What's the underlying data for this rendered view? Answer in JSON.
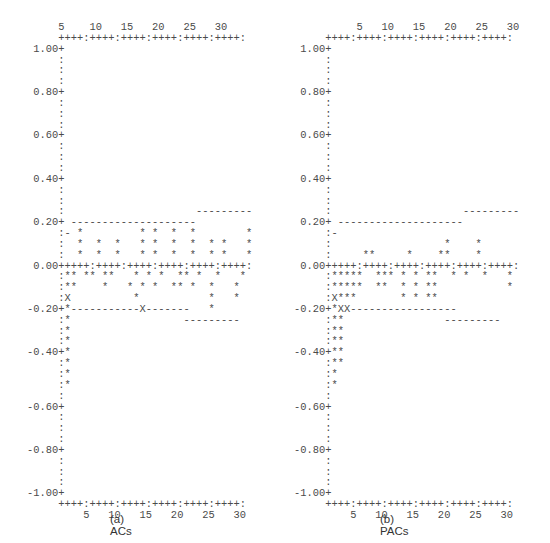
{
  "chart_data": [
    {
      "type": "bar",
      "title": "(a) ACs",
      "style": "ascii-correlogram",
      "xlabel": "lag",
      "ylabel": "autocorrelation",
      "x_ticks": [
        5,
        10,
        15,
        20,
        25,
        30
      ],
      "y_ticks": [
        "1.00",
        "0.80",
        "0.60",
        "0.40",
        "0.20",
        "0.00",
        "-0.20",
        "-0.40",
        "-0.60",
        "-0.80",
        "-1.00"
      ],
      "ylim": [
        -1.0,
        1.0
      ],
      "xlim": [
        1,
        30
      ],
      "confidence_bands": {
        "lags_1_20": [
          -0.2,
          0.2
        ],
        "lags_23_30": [
          -0.25,
          0.25
        ]
      },
      "description": "Lag 1 ACF strongly negative (~-0.5); remaining lags small within bands",
      "lines": [
        "     5    10   15   20   25   30",
        "+++++:++++:++++:++++:++++:++++:",
        "1.00+",
        "    :",
        "    :",
        "    :",
        "0.80+",
        "    :",
        "    :",
        "    :",
        "0.60+",
        "    :",
        "    :",
        "    :",
        "0.40+",
        "    :",
        "    :",
        "    :                     ---------",
        "0.20+ --------------------",
        "    :- *         * *  *  *        *",
        "    :  *  *  *   * *  *  *  * *   *",
        "    :  *  *  *   * *  *  *  * *   *",
        "0.00+++++:++++:++++:++++:++++:++++:",
        "    :** ** **   * * *  ** *  *   *",
        "    :**    *   * * *  ** *  *   *",
        "    :X          *           *   *",
        "-0.20+*-----------X-------   *",
        "    :*                  ---------",
        "    :*",
        "    :*",
        "-0.40+*",
        "    :*",
        "    :*",
        "    :*",
        "    :",
        "-0.60+",
        "    :",
        "    :",
        "    :",
        "-0.80+",
        "    :",
        "    :",
        "    :",
        "-1.00+",
        "     ++++:++++:++++:++++:++++:++++:",
        "          5   10   15   20   25   30"
      ]
    },
    {
      "type": "bar",
      "title": "(b) PACs",
      "style": "ascii-correlogram",
      "xlabel": "lag",
      "ylabel": "partial autocorrelation",
      "x_ticks": [
        5,
        10,
        15,
        20,
        25,
        30
      ],
      "y_ticks": [
        "1.00",
        "0.80",
        "0.60",
        "0.40",
        "0.20",
        "0.00",
        "-0.20",
        "-0.40",
        "-0.60",
        "-0.80",
        "-1.00"
      ],
      "ylim": [
        -1.0,
        1.0
      ],
      "xlim": [
        1,
        30
      ],
      "confidence_bands": {
        "lags_1_20": [
          -0.2,
          0.2
        ],
        "lags_23_30": [
          -0.25,
          0.25
        ]
      },
      "description": "Lag 1 PACF strongly negative (~-0.5); lag 2 ~ -0.45; others small"
    }
  ],
  "panels": {
    "a": {
      "caption": "(a) ACs",
      "lines": [
        "     5    10   15   20   25   30",
        "     ++++:++++:++++:++++:++++:++++:",
        " 1.00+",
        "     :",
        "     :",
        "     :",
        " 0.80+",
        "     :",
        "     :",
        "     :",
        " 0.60+",
        "     :",
        "     :",
        "     :",
        " 0.40+",
        "     :",
        "     :",
        "     :                     ---------",
        " 0.20+ --------------------",
        "     :- *         * *  *  *        *",
        "     :  *  *  *   * *  *  *  * *   *",
        "     :  *  *  *   * *  *  *  * *   *",
        " 0.00+++++:++++:++++:++++:++++:++++:",
        "     :** ** **   * * *  ** *  *   *",
        "     :**    *   * * *  ** *  *   *",
        "     :X          *           *   *",
        "-0.20+*-----------X-------   *",
        "     :*                  ---------",
        "     :*",
        "     :*",
        "-0.40+*",
        "     :*",
        "     :*",
        "     :*",
        "     :",
        "-0.60+",
        "     :",
        "     :",
        "     :",
        "-0.80+",
        "     :",
        "     :",
        "     :",
        "-1.00+",
        "     ++++:++++:++++:++++:++++:++++:",
        "         5   10   15   20   25   30"
      ]
    },
    "b": {
      "caption": "(b) PACs",
      "lines": [
        "          5   10   15   20   25   30",
        "     ++++:++++:++++:++++:++++:++++:",
        " 1.00+",
        "     :",
        "     :",
        "     :",
        " 0.80+",
        "     :",
        "     :",
        "     :",
        " 0.60+",
        "     :",
        "     :",
        "     :",
        " 0.40+",
        "     :",
        "     :",
        "     :                     ---------",
        " 0.20+ --------------------",
        "     :-",
        "     :                  *    *",
        "     :     **     *    **    *",
        " 0.00+++++:++++:++++:++++:++++:++++:",
        "     :*****  *** * * **  * *  *   *",
        "     :*****  **  * * **           *",
        "     :X***       * * **",
        "-0.20+*XX-----------------",
        "     :**                ---------",
        "     :**",
        "     :**",
        "-0.40+**",
        "     :**",
        "     :*",
        "     :*",
        "     :",
        "-0.60+",
        "     :",
        "     :",
        "     :",
        "-0.80+",
        "     :",
        "     :",
        "     :",
        "-1.00+",
        "     ++++:++++:++++:++++:++++:++++:",
        "         5   10   15   20   25   30"
      ]
    }
  }
}
